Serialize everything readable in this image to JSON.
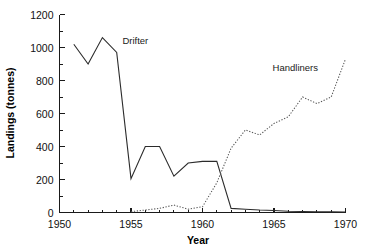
{
  "chart_data": {
    "type": "line",
    "title": "",
    "xlabel": "Year",
    "ylabel": "Landings (tonnes)",
    "xlim": [
      1950,
      1970
    ],
    "ylim": [
      0,
      1200
    ],
    "xticks": [
      1950,
      1955,
      1960,
      1965,
      1970
    ],
    "xtick_labels": [
      "1950",
      "1955",
      "1960",
      "1965",
      "1970"
    ],
    "xtick_minor_step": 1,
    "yticks": [
      0,
      200,
      400,
      600,
      800,
      1000,
      1200
    ],
    "ytick_labels": [
      "0",
      "200",
      "400",
      "600",
      "800",
      "1000",
      "1200"
    ],
    "ytick_minor_step": 100,
    "grid": false,
    "legend_position": "inline-annotation",
    "series": [
      {
        "name": "Drifter",
        "style": "solid",
        "color": "#2b2b2b",
        "annotation": "Drifter",
        "annotation_x": 1954.4,
        "annotation_y": 1020,
        "x": [
          1951,
          1952,
          1953,
          1954,
          1955,
          1956,
          1957,
          1958,
          1959,
          1960,
          1961,
          1962,
          1963,
          1964,
          1965,
          1966,
          1967,
          1968,
          1969,
          1970
        ],
        "values": [
          1020,
          900,
          1060,
          970,
          205,
          400,
          400,
          220,
          300,
          310,
          310,
          25,
          20,
          15,
          12,
          8,
          6,
          5,
          4,
          3
        ]
      },
      {
        "name": "Handliners",
        "style": "dotted",
        "color": "#555555",
        "annotation": "Handliners",
        "annotation_x": 1964.9,
        "annotation_y": 855,
        "x": [
          1955,
          1956,
          1957,
          1958,
          1959,
          1960,
          1961,
          1962,
          1963,
          1964,
          1965,
          1966,
          1967,
          1968,
          1969,
          1970
        ],
        "values": [
          5,
          15,
          25,
          45,
          20,
          35,
          180,
          390,
          500,
          470,
          540,
          580,
          700,
          660,
          700,
          930
        ]
      }
    ]
  }
}
